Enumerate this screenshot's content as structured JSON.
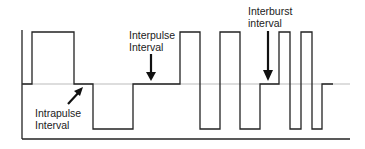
{
  "diagram": {
    "type": "pulse-waveform",
    "labels": {
      "intrapulse_line1": "Intrapulse",
      "intrapulse_line2": "Interval",
      "interpulse_line1": "Interpulse",
      "interpulse_line2": "Interval",
      "interburst_line1": "Interburst",
      "interburst_line2": "interval"
    },
    "levels": {
      "high": 32,
      "baseline": 84,
      "low": 129
    },
    "waveform_points": [
      [
        22,
        84
      ],
      [
        32,
        84
      ],
      [
        32,
        32
      ],
      [
        74,
        32
      ],
      [
        74,
        84
      ],
      [
        93,
        84
      ],
      [
        93,
        129
      ],
      [
        133,
        129
      ],
      [
        133,
        84
      ],
      [
        180,
        84
      ],
      [
        180,
        32
      ],
      [
        200,
        32
      ],
      [
        200,
        129
      ],
      [
        220,
        129
      ],
      [
        220,
        32
      ],
      [
        240,
        32
      ],
      [
        240,
        129
      ],
      [
        260,
        129
      ],
      [
        260,
        84
      ],
      [
        279,
        84
      ],
      [
        279,
        32
      ],
      [
        290,
        32
      ],
      [
        290,
        129
      ],
      [
        301,
        129
      ],
      [
        301,
        32
      ],
      [
        312,
        32
      ],
      [
        312,
        129
      ],
      [
        322,
        129
      ],
      [
        322,
        84
      ],
      [
        333,
        84
      ]
    ],
    "colors": {
      "line": "#222222",
      "baseline": "#aaaaaa"
    }
  }
}
